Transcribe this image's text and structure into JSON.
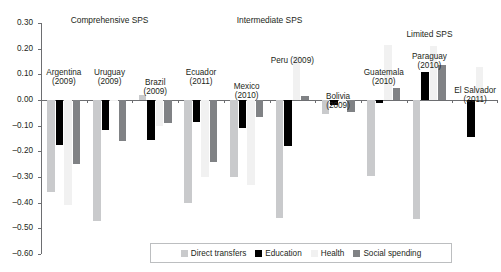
{
  "chart_data": {
    "type": "bar",
    "title": "",
    "xlabel": "",
    "ylabel": "",
    "ylim": [
      -0.6,
      0.3
    ],
    "ytick_labels": [
      "0.30",
      "0.20",
      "0.10",
      "0.00",
      "-0.10",
      "-0.20",
      "-0.30",
      "-0.40",
      "-0.50",
      "-0.60"
    ],
    "ytick_values": [
      0.3,
      0.2,
      0.1,
      0.0,
      -0.1,
      -0.2,
      -0.3,
      -0.4,
      -0.5,
      -0.6
    ],
    "grid": false,
    "legend_position": "bottom",
    "categories": [
      "Argentina (2009)",
      "Uruguay (2009)",
      "Brazil (2009)",
      "Ecuador (2011)",
      "Mexico (2010)",
      "Peru (2009)",
      "Bolivia (2009)",
      "Guatemala (2010)",
      "Paraguay (2010)",
      "El Salvador (2011)"
    ],
    "series": [
      {
        "name": "Direct transfers",
        "color": "#c9cacc",
        "values": [
          -0.36,
          -0.47,
          0.02,
          -0.4,
          -0.3,
          -0.46,
          -0.055,
          -0.295,
          -0.465,
          0.0
        ]
      },
      {
        "name": "Education",
        "color": "#000000",
        "values": [
          -0.175,
          -0.115,
          -0.155,
          -0.085,
          -0.11,
          -0.18,
          -0.02,
          -0.01,
          0.11,
          -0.145
        ]
      },
      {
        "name": "Health",
        "color": "#f1f1f1",
        "values": [
          -0.41,
          -0.005,
          -0.1,
          -0.3,
          -0.33,
          0.17,
          -0.01,
          0.215,
          0.21,
          0.13
        ]
      },
      {
        "name": "Social spending",
        "color": "#808285",
        "values": [
          -0.25,
          -0.16,
          -0.09,
          -0.24,
          -0.065,
          0.015,
          -0.045,
          0.045,
          0.135,
          0.0
        ]
      }
    ]
  },
  "groups": [
    {
      "label": "Comprehensive SPS",
      "span_start": 0,
      "span_end": 2
    },
    {
      "label": "Intermediate SPS",
      "span_start": 3,
      "span_end": 6
    },
    {
      "label": "Limited SPS",
      "span_start": 7,
      "span_end": 9
    }
  ],
  "country_labels": [
    {
      "line1": "Argentina",
      "line2": "(2009)"
    },
    {
      "line1": "Uruguay",
      "line2": "(2009)"
    },
    {
      "line1": "Brazil",
      "line2": "(2009)"
    },
    {
      "line1": "Ecuador",
      "line2": "(2011)"
    },
    {
      "line1": "Mexico",
      "line2": "(2010)"
    },
    {
      "line1": "Peru (2009)",
      "line2": ""
    },
    {
      "line1": "Bolivia",
      "line2": "(2009)"
    },
    {
      "line1": "Guatemala",
      "line2": "(2010)"
    },
    {
      "line1": "Paraguay",
      "line2": "(2010)"
    },
    {
      "line1": "El Salvador",
      "line2": "(2011)"
    }
  ],
  "legend": {
    "items": [
      {
        "label": "Direct transfers",
        "color": "#c9cacc"
      },
      {
        "label": "Education",
        "color": "#000000"
      },
      {
        "label": "Health",
        "color": "#f1f1f1"
      },
      {
        "label": "Social spending",
        "color": "#808285"
      }
    ]
  }
}
